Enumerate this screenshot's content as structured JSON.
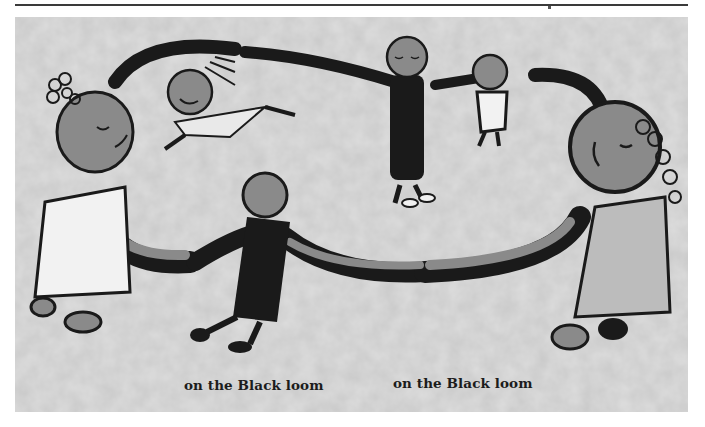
{
  "page": {
    "header_rule": true
  },
  "illustration": {
    "description": "Ink illustration of five children holding hands in a circle, dancing",
    "colors": {
      "background": "#cfcfcf",
      "ink": "#1a1a1a",
      "skin": "#8a8a8a",
      "dress_light": "#f2f2f2",
      "dress_mid": "#bcbcbc"
    }
  },
  "captions": [
    {
      "text": "on the Black loom"
    },
    {
      "text": "on the Black loom"
    }
  ]
}
